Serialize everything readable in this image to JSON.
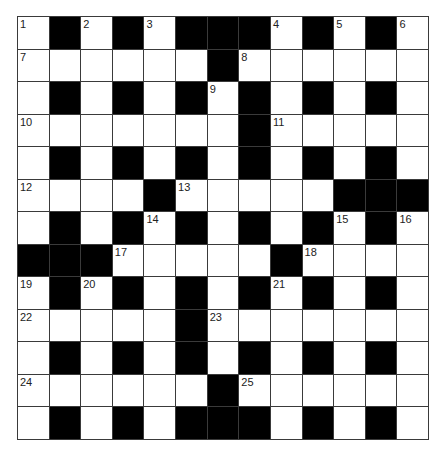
{
  "puzzle": {
    "type": "crossword",
    "rows": 13,
    "cols": 13,
    "colors": {
      "block": "#000000",
      "cell": "#ffffff",
      "line": "#3a3a3a"
    },
    "layout": [
      "W.W.W...W.W.W",
      "WWWWWW.WWWWWW",
      "W.W.W.W.W.W.W",
      "WWWWWWW.WWWWW",
      "W.W.W.W.W.W.W",
      "WWWW.WWWWW...",
      "W.W.W.W.W.W.W",
      "...WWWWW.WWWW",
      "W.W.W.W.W.W.W",
      "WWWWW.WWWWWWW",
      "W.W.W.W.W.W.W",
      "WWWWWW.WWWWWW",
      "W.W.W...W.W.W"
    ],
    "numbers": [
      {
        "n": "1",
        "r": 0,
        "c": 0
      },
      {
        "n": "2",
        "r": 0,
        "c": 2
      },
      {
        "n": "3",
        "r": 0,
        "c": 4
      },
      {
        "n": "4",
        "r": 0,
        "c": 8
      },
      {
        "n": "5",
        "r": 0,
        "c": 10
      },
      {
        "n": "6",
        "r": 0,
        "c": 12
      },
      {
        "n": "7",
        "r": 1,
        "c": 0
      },
      {
        "n": "8",
        "r": 1,
        "c": 7
      },
      {
        "n": "9",
        "r": 2,
        "c": 6
      },
      {
        "n": "10",
        "r": 3,
        "c": 0
      },
      {
        "n": "11",
        "r": 3,
        "c": 8
      },
      {
        "n": "12",
        "r": 5,
        "c": 0
      },
      {
        "n": "13",
        "r": 5,
        "c": 5
      },
      {
        "n": "14",
        "r": 6,
        "c": 4
      },
      {
        "n": "15",
        "r": 6,
        "c": 10
      },
      {
        "n": "16",
        "r": 6,
        "c": 12
      },
      {
        "n": "17",
        "r": 7,
        "c": 3
      },
      {
        "n": "18",
        "r": 7,
        "c": 9
      },
      {
        "n": "19",
        "r": 8,
        "c": 0
      },
      {
        "n": "20",
        "r": 8,
        "c": 2
      },
      {
        "n": "21",
        "r": 8,
        "c": 8
      },
      {
        "n": "22",
        "r": 9,
        "c": 0
      },
      {
        "n": "23",
        "r": 9,
        "c": 6
      },
      {
        "n": "24",
        "r": 11,
        "c": 0
      },
      {
        "n": "25",
        "r": 11,
        "c": 7
      }
    ]
  }
}
